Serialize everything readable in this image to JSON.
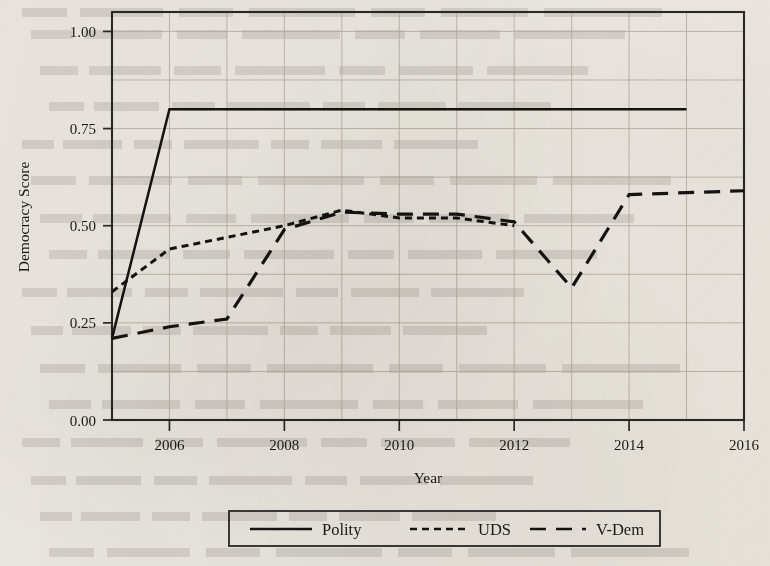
{
  "figure": {
    "kind": "line-chart",
    "y_axis_label": "Democracy Score",
    "x_axis_label": "Year"
  },
  "chart_data": {
    "type": "line",
    "title": "",
    "xlabel": "Year",
    "ylabel": "Democracy Score",
    "xlim": [
      2005,
      2016
    ],
    "ylim": [
      0.0,
      1.05
    ],
    "xticks": [
      2006,
      2008,
      2010,
      2012,
      2014,
      2016
    ],
    "xtick_labels": [
      "2006",
      "2008",
      "2010",
      "2012",
      "2014",
      "2016"
    ],
    "yticks": [
      0.0,
      0.25,
      0.5,
      0.75,
      1.0
    ],
    "ytick_labels": [
      "0.00",
      "0.25",
      "0.50",
      "0.75",
      "1.00"
    ],
    "grid": true,
    "grid_minor": true,
    "legend_position": "below-center",
    "legend_entries": [
      "Polity",
      "UDS",
      "V-Dem"
    ],
    "series": [
      {
        "name": "Polity",
        "style": "solid",
        "x": [
          2005,
          2006,
          2007,
          2008,
          2009,
          2010,
          2011,
          2012,
          2013,
          2014,
          2015
        ],
        "values": [
          0.21,
          0.8,
          0.8,
          0.8,
          0.8,
          0.8,
          0.8,
          0.8,
          0.8,
          0.8,
          0.8
        ]
      },
      {
        "name": "UDS",
        "style": "dotted",
        "x": [
          2005,
          2006,
          2007,
          2008,
          2009,
          2010,
          2011,
          2012
        ],
        "values": [
          0.33,
          0.44,
          0.47,
          0.5,
          0.54,
          0.52,
          0.52,
          0.5
        ]
      },
      {
        "name": "V-Dem",
        "style": "dashed",
        "x": [
          2005,
          2006,
          2007,
          2008,
          2009,
          2010,
          2011,
          2012,
          2013,
          2014,
          2015,
          2016
        ],
        "values": [
          0.21,
          0.24,
          0.26,
          0.49,
          0.535,
          0.53,
          0.53,
          0.51,
          0.34,
          0.58,
          0.585,
          0.59
        ]
      }
    ]
  },
  "colors": {
    "ink": "#141414",
    "paper": "#f4f2ee",
    "grid": "#b9b4ab",
    "frame": "#2a2a2a"
  }
}
